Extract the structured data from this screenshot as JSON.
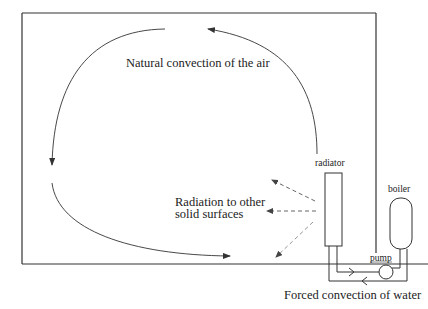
{
  "diagram": {
    "labels": {
      "natural_convection": "Natural convection of the air",
      "radiation_line1": "Radiation to other",
      "radiation_line2": "solid surfaces",
      "radiator": "radiator",
      "boiler": "boiler",
      "pump": "pump",
      "forced_convection": "Forced convection of water"
    },
    "colors": {
      "line": "#333333",
      "dashed": "#555555",
      "background": "#ffffff"
    }
  }
}
